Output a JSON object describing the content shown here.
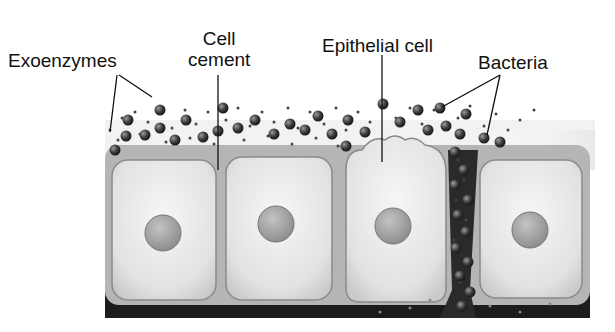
{
  "diagram": {
    "labels": {
      "exoenzymes": "Exoenzymes",
      "cell_cement_line1": "Cell",
      "cell_cement_line2": "cement",
      "epithelial_cell": "Epithelial cell",
      "bacteria": "Bacteria"
    },
    "cells": [
      {
        "name": "cell-1",
        "x": 108,
        "y": 158,
        "w": 110,
        "h": 145,
        "nucleus": {
          "cx": 160,
          "cy": 233,
          "r": 18
        }
      },
      {
        "name": "cell-2",
        "x": 222,
        "y": 155,
        "w": 112,
        "h": 148,
        "nucleus": {
          "cx": 276,
          "cy": 224,
          "r": 18
        }
      },
      {
        "name": "cell-3",
        "x": 342,
        "y": 148,
        "w": 106,
        "h": 157,
        "nucleus": {
          "cx": 393,
          "cy": 226,
          "r": 18
        }
      },
      {
        "name": "cell-4",
        "x": 478,
        "y": 160,
        "w": 104,
        "h": 140,
        "nucleus": {
          "cx": 530,
          "cy": 230,
          "r": 18
        }
      }
    ],
    "colors": {
      "cell_fill": "#e4e4e4",
      "cell_border": "#8a8a8a",
      "cement": "#b8b8b8",
      "nucleus": "#9c9c9c",
      "basement": "#1c1c1c",
      "bacteria": "#3a3a3a",
      "exoenzyme": "#444444"
    }
  }
}
